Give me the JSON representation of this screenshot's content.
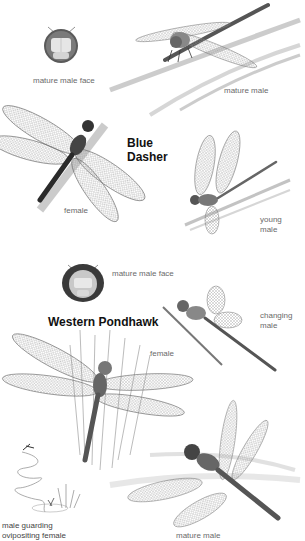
{
  "plate": {
    "species": [
      {
        "name": "Blue Dasher",
        "name_lines": [
          "Blue",
          "Dasher"
        ],
        "figures": [
          {
            "label": "mature male face"
          },
          {
            "label": "mature male"
          },
          {
            "label": "female"
          },
          {
            "label": "young male",
            "label_lines": [
              "young",
              "male"
            ]
          }
        ]
      },
      {
        "name": "Western Pondhawk",
        "figures": [
          {
            "label": "mature male face"
          },
          {
            "label": "changing male",
            "label_lines": [
              "changing",
              "male"
            ]
          },
          {
            "label": "female"
          },
          {
            "label": "male guarding ovipositing female",
            "label_lines": [
              "male guarding",
              "ovipositing female"
            ]
          },
          {
            "label": "mature male"
          }
        ]
      }
    ]
  }
}
